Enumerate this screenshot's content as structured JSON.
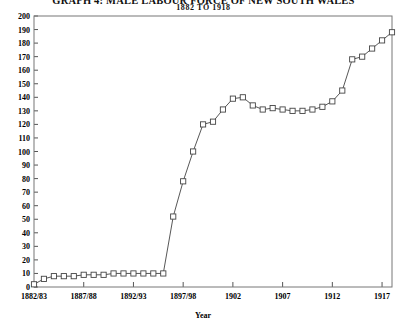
{
  "chart_data": {
    "type": "line",
    "title": "GRAPH 4: MALE LABOUR FORCE OF NEW SOUTH WALES",
    "subtitle": "1882 TO 1918",
    "xlabel": "Year",
    "ylabel": "",
    "xlim": [
      1882,
      1918
    ],
    "ylim": [
      0,
      200
    ],
    "ytick_step": 10,
    "grid": false,
    "legend": "none",
    "marker": "open-square",
    "line_color": "#333333",
    "xticks": [
      {
        "value": 1882,
        "label": "1882/83"
      },
      {
        "value": 1887,
        "label": "1887/88"
      },
      {
        "value": 1892,
        "label": "1892/93"
      },
      {
        "value": 1897,
        "label": "1897/98"
      },
      {
        "value": 1902,
        "label": "1902"
      },
      {
        "value": 1907,
        "label": "1907"
      },
      {
        "value": 1912,
        "label": "1912"
      },
      {
        "value": 1917,
        "label": "1917"
      }
    ],
    "yticks": [
      0,
      10,
      20,
      30,
      40,
      50,
      60,
      70,
      80,
      90,
      100,
      110,
      120,
      130,
      140,
      150,
      160,
      170,
      180,
      190,
      200
    ],
    "x": [
      1882,
      1883,
      1884,
      1885,
      1886,
      1887,
      1888,
      1889,
      1890,
      1891,
      1892,
      1893,
      1894,
      1895,
      1896,
      1897,
      1898,
      1899,
      1900,
      1901,
      1902,
      1903,
      1904,
      1905,
      1906,
      1907,
      1908,
      1909,
      1910,
      1911,
      1912,
      1913,
      1914,
      1915,
      1916,
      1917,
      1918
    ],
    "values": [
      2,
      6,
      8,
      8,
      8,
      9,
      9,
      9,
      10,
      10,
      10,
      10,
      10,
      10,
      52,
      78,
      100,
      120,
      122,
      131,
      139,
      140,
      134,
      131,
      132,
      131,
      130,
      130,
      131,
      133,
      137,
      145,
      168,
      170,
      176,
      182,
      188
    ],
    "series": [
      {
        "name": "Male labour force",
        "values": [
          2,
          6,
          8,
          8,
          8,
          9,
          9,
          9,
          10,
          10,
          10,
          10,
          10,
          10,
          52,
          78,
          100,
          120,
          122,
          131,
          139,
          140,
          134,
          131,
          132,
          131,
          130,
          130,
          131,
          133,
          137,
          145,
          168,
          170,
          176,
          182,
          188
        ]
      }
    ]
  }
}
